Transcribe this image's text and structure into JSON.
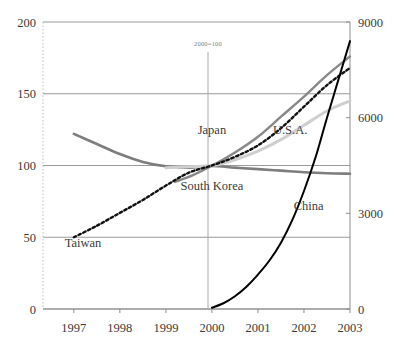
{
  "chart_data": {
    "type": "line",
    "title": "",
    "subtitle": "",
    "annotation": "2000=100",
    "xlabel": "",
    "ylabel": "",
    "grid": true,
    "legend": "inline-labels",
    "x": [
      1997,
      1998,
      1999,
      2000,
      2001,
      2002,
      2003
    ],
    "xtick_labels": [
      "1997",
      "1998",
      "1999",
      "2000",
      "2001",
      "2002",
      "2003"
    ],
    "xlim": [
      1996.33,
      2003.0
    ],
    "left_axis": {
      "label": "",
      "ylim": [
        0,
        200
      ],
      "ticks": [
        0,
        50,
        100,
        150,
        200
      ],
      "tick_labels": [
        "0",
        "50",
        "100",
        "150",
        "200"
      ]
    },
    "right_axis": {
      "label": "",
      "ylim": [
        0,
        9000
      ],
      "ticks": [
        0,
        3000,
        6000,
        9000
      ],
      "tick_labels": [
        "0",
        "3000",
        "6000",
        "9000"
      ]
    },
    "series": [
      {
        "name": "Japan",
        "axis": "left",
        "style": "solid",
        "color": "#7d7d7d",
        "width": 2.6,
        "label_x": 2000.0,
        "label_y": 122,
        "x": [
          1997.0,
          1997.5,
          1998.0,
          1998.5,
          1999.0,
          1999.5,
          2000.0,
          2000.5,
          2001.0,
          2001.5,
          2002.0,
          2002.5,
          2003.0
        ],
        "values": [
          122,
          115,
          108,
          102.5,
          99.5,
          98.5,
          99.6,
          98.5,
          97.5,
          96.4,
          95.3,
          94.6,
          94.3
        ]
      },
      {
        "name": "South Korea",
        "axis": "left",
        "style": "solid",
        "color": "#888888",
        "width": 2.4,
        "label_x": 2000.0,
        "label_y": 83,
        "x": [
          1999.2,
          1999.6,
          2000.0,
          2000.5,
          2001.0,
          2001.5,
          2002.0,
          2002.5,
          2003.0
        ],
        "values": [
          88.5,
          93.5,
          99.8,
          109,
          120,
          134,
          148,
          163,
          176
        ]
      },
      {
        "name": "U.S.A.",
        "axis": "left",
        "style": "solid",
        "color": "#cfcfcf",
        "width": 3.0,
        "label_x": 2001.7,
        "label_y": 122,
        "x": [
          1999.0,
          1999.5,
          2000.0,
          2000.5,
          2001.0,
          2001.5,
          2002.0,
          2002.5,
          2003.0
        ],
        "values": [
          98.5,
          99.2,
          100,
          104,
          110,
          118,
          128,
          138,
          145
        ]
      },
      {
        "name": "Taiwan",
        "axis": "left",
        "style": "dotted",
        "color": "#111111",
        "width": 2.4,
        "label_x": 1997.2,
        "label_y": 43,
        "x": [
          1997.0,
          1997.5,
          1998.0,
          1998.5,
          1999.0,
          1999.5,
          2000.0,
          2000.5,
          2001.0,
          2001.5,
          2002.0,
          2002.5,
          2003.0
        ],
        "values": [
          50,
          58,
          67,
          76,
          86,
          95,
          100,
          106,
          114,
          126,
          141,
          156,
          168
        ]
      },
      {
        "name": "China",
        "axis": "right",
        "style": "solid",
        "color": "#000000",
        "width": 2.0,
        "label_x": 2002.1,
        "label_y": 3100,
        "x": [
          2000.0,
          2000.25,
          2000.5,
          2000.75,
          2001.0,
          2001.25,
          2001.5,
          2001.75,
          2002.0,
          2002.25,
          2002.5,
          2002.75,
          2003.0
        ],
        "values": [
          40,
          180,
          400,
          700,
          1080,
          1520,
          2080,
          2800,
          3700,
          4750,
          6000,
          7200,
          8400
        ]
      }
    ]
  }
}
